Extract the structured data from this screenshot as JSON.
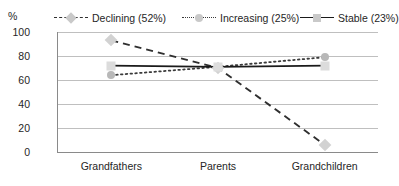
{
  "axis_unit_label": "%",
  "legend": {
    "position": "top",
    "items": [
      {
        "label": "Declining (52%)",
        "style": "dashed",
        "marker": "diamond",
        "color": "#2f2f2f",
        "marker_color": "#d2d2d2"
      },
      {
        "label": "Increasing (25%)",
        "style": "dotted",
        "marker": "circle",
        "color": "#3a3a3a",
        "marker_color": "#b8b8b8"
      },
      {
        "label": "Stable (23%)",
        "style": "solid",
        "marker": "square",
        "color": "#1a1a1a",
        "marker_color": "#dcdcdc"
      }
    ]
  },
  "chart_data": {
    "type": "line",
    "title": "",
    "xlabel": "",
    "ylabel": "%",
    "categories": [
      "Grandfathers",
      "Parents",
      "Grandchildren"
    ],
    "ylim": [
      0,
      100
    ],
    "yticks": [
      0,
      20,
      40,
      60,
      80,
      100
    ],
    "ytick_labels": [
      "0",
      "20",
      "40",
      "60",
      "80",
      "100"
    ],
    "grid": true,
    "legend_position": "top",
    "series": [
      {
        "name": "Declining (52%)",
        "values": [
          93,
          70,
          6
        ]
      },
      {
        "name": "Increasing (25%)",
        "values": [
          64,
          71,
          79
        ]
      },
      {
        "name": "Stable (23%)",
        "values": [
          72,
          71,
          72
        ]
      }
    ]
  }
}
